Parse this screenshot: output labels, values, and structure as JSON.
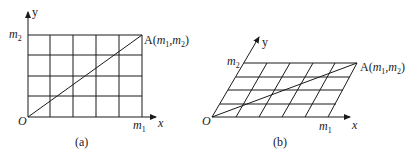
{
  "panels": [
    {
      "id": "a",
      "caption": "(a)",
      "type": "rectangular-grid",
      "axis_x_label": "x",
      "axis_y_label": "y",
      "origin_label": "O",
      "x_tick_label": {
        "base": "m",
        "sub": "1"
      },
      "y_tick_label": {
        "base": "m",
        "sub": "2"
      },
      "point_label": {
        "name": "A",
        "open": "(",
        "x_base": "m",
        "x_sub": "1",
        "sep": ",",
        "y_base": "m",
        "y_sub": "2",
        "close": ")"
      },
      "grid_columns": 5,
      "grid_rows": 4
    },
    {
      "id": "b",
      "caption": "(b)",
      "type": "oblique-grid",
      "axis_x_label": "x",
      "axis_y_label": "y",
      "origin_label": "O",
      "x_tick_label": {
        "base": "m",
        "sub": "1"
      },
      "y_tick_label": {
        "base": "m",
        "sub": "2"
      },
      "point_label": {
        "name": "A",
        "open": "(",
        "x_base": "m",
        "x_sub": "1",
        "sep": ",",
        "y_base": "m",
        "y_sub": "2",
        "close": ")"
      },
      "grid_columns": 5,
      "grid_rows": 4
    }
  ],
  "colors": {
    "stroke": "#1a1a1a",
    "background": "#ffffff"
  }
}
